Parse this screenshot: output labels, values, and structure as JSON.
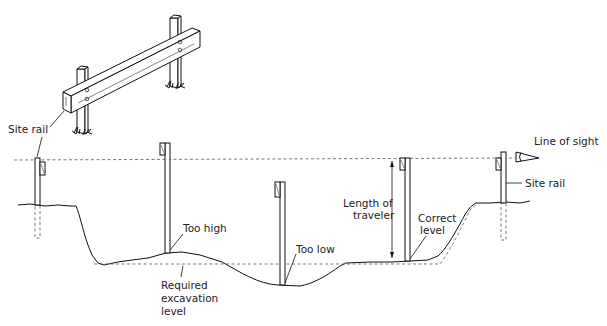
{
  "diagram": {
    "type": "excavation-level-check",
    "labels": {
      "site_rail_top": "Site rail",
      "line_of_sight": "Line of sight",
      "site_rail_right": "Site rail",
      "length_of_traveler_1": "Length of",
      "length_of_traveler_2": "traveler",
      "correct_level_1": "Correct",
      "correct_level_2": "level",
      "too_high": "Too high",
      "too_low": "Too low",
      "required_1": "Required",
      "required_2": "excavation",
      "required_3": "level"
    },
    "elements": [
      {
        "name": "site-rail-perspective",
        "description": "Rail on two posts, isometric view"
      },
      {
        "name": "line-of-sight",
        "style": "dashed",
        "y": 163
      },
      {
        "name": "required-excavation-level",
        "style": "dashed",
        "y": 264
      },
      {
        "name": "left-site-rail-stake",
        "x": 38
      },
      {
        "name": "traveler-too-high",
        "x": 166
      },
      {
        "name": "traveler-too-low",
        "x": 282
      },
      {
        "name": "traveler-correct",
        "x": 409
      },
      {
        "name": "right-site-rail-stake",
        "x": 504
      },
      {
        "name": "eye-icon",
        "x": 520,
        "y": 163
      }
    ],
    "colors": {
      "line": "#111111",
      "dashed": "#555555",
      "background": "#ffffff"
    }
  }
}
